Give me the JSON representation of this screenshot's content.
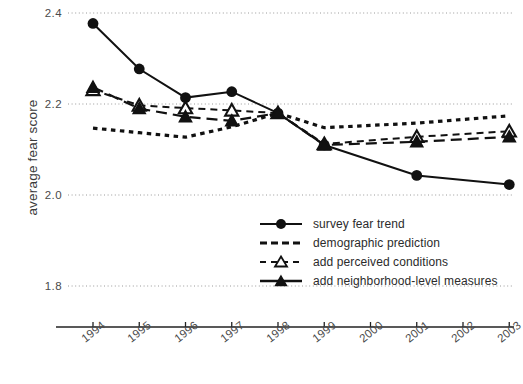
{
  "chart_data": {
    "type": "line",
    "title": "",
    "xlabel": "",
    "ylabel": "average fear score",
    "x": [
      "1994",
      "1995",
      "1996",
      "1997",
      "1998",
      "1999",
      "2000",
      "2001",
      "2002",
      "2003"
    ],
    "categories": [
      "1994",
      "1995",
      "1996",
      "1997",
      "1998",
      "1999",
      "2000",
      "2001",
      "2002",
      "2003"
    ],
    "ylim": [
      1.8,
      2.4
    ],
    "y_ticks": [
      "2.4",
      "2.2",
      "2.0",
      "1.8"
    ],
    "y_tick_values": [
      2.4,
      2.2,
      2.0,
      1.8
    ],
    "grid": true,
    "grid_style": "dotted-horizontal",
    "legend_position": "inside lower right",
    "series": [
      {
        "name": "survey fear trend",
        "marker": "filled-circle",
        "line": "solid",
        "x": [
          "1994",
          "1995",
          "1996",
          "1997",
          "1998",
          "1999",
          "2001",
          "2003"
        ],
        "values": [
          2.377,
          2.277,
          2.214,
          2.227,
          2.18,
          2.11,
          2.043,
          2.023
        ]
      },
      {
        "name": "demographic prediction",
        "marker": "none",
        "line": "dotted",
        "x": [
          "1994",
          "1995",
          "1996",
          "1997",
          "1998",
          "1999",
          "2001",
          "2003"
        ],
        "values": [
          2.147,
          2.137,
          2.127,
          2.15,
          2.18,
          2.148,
          2.158,
          2.174
        ]
      },
      {
        "name": "add perceived conditions",
        "marker": "open-triangle",
        "line": "dashed",
        "x": [
          "1994",
          "1995",
          "1996",
          "1997",
          "1998",
          "1999",
          "2001",
          "2003"
        ],
        "values": [
          2.231,
          2.197,
          2.191,
          2.186,
          2.18,
          2.112,
          2.128,
          2.14
        ]
      },
      {
        "name": "add neighborhood-level measures",
        "marker": "filled-triangle",
        "line": "long-dash",
        "x": [
          "1994",
          "1995",
          "1996",
          "1997",
          "1998",
          "1999",
          "2001",
          "2003"
        ],
        "values": [
          2.237,
          2.19,
          2.172,
          2.163,
          2.18,
          2.11,
          2.117,
          2.128
        ]
      }
    ]
  },
  "axes": {
    "y_title": "average fear score"
  },
  "legend": {
    "items": [
      {
        "label": "survey fear trend",
        "key": "filled-circle-solid-line-key"
      },
      {
        "label": "demographic prediction",
        "key": "dotted-line-key"
      },
      {
        "label": "add perceived conditions",
        "key": "open-triangle-dashed-line-key"
      },
      {
        "label": "add neighborhood-level measures",
        "key": "filled-triangle-dashed-line-key"
      }
    ]
  }
}
